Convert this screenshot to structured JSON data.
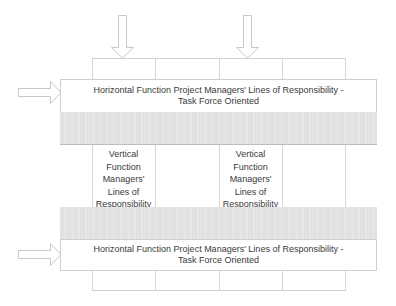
{
  "diagram": {
    "type": "matrix-organization",
    "top_arrows": [
      {
        "direction": "down",
        "column": 1
      },
      {
        "direction": "down",
        "column": 3
      }
    ],
    "horizontal_boxes": [
      {
        "line1": "Horizontal Function Project Managers' Lines of Responsibility -",
        "line2": "Task Force Oriented",
        "arrow": "right"
      },
      {
        "line1": "Horizontal Function Project Managers' Lines of Responsibility -",
        "line2": "Task Force Oriented",
        "arrow": "right"
      }
    ],
    "vertical_labels": [
      {
        "lines": [
          "Vertical",
          "Function",
          "Managers'",
          "Lines of",
          "Responsibility"
        ]
      },
      {
        "lines": [
          "Vertical",
          "Function",
          "Managers'",
          "Lines of",
          "Responsibility"
        ]
      }
    ],
    "column_count": 4,
    "colors": {
      "line": "#cfcfcf",
      "band": "#e4e4e4",
      "text": "#3a3a3a",
      "arrow_stroke": "#c8c8c8"
    }
  }
}
